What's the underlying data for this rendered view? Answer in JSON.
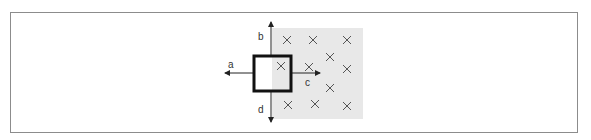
{
  "diagram": {
    "field": {
      "symbol": "×",
      "direction": "into-page",
      "region_color": "#e8e8e8",
      "marks": [
        {
          "x": 287,
          "y": 40
        },
        {
          "x": 313,
          "y": 40
        },
        {
          "x": 347,
          "y": 40
        },
        {
          "x": 281,
          "y": 66
        },
        {
          "x": 309,
          "y": 67
        },
        {
          "x": 330,
          "y": 57
        },
        {
          "x": 347,
          "y": 69
        },
        {
          "x": 330,
          "y": 88
        },
        {
          "x": 288,
          "y": 105
        },
        {
          "x": 315,
          "y": 104
        },
        {
          "x": 347,
          "y": 106
        }
      ]
    },
    "loop": {
      "shape": "square",
      "color": "#111111"
    },
    "arrows": {
      "a": {
        "label": "a",
        "direction": "left"
      },
      "b": {
        "label": "b",
        "direction": "up"
      },
      "c": {
        "label": "c",
        "direction": "right"
      },
      "d": {
        "label": "d",
        "direction": "down"
      }
    }
  }
}
